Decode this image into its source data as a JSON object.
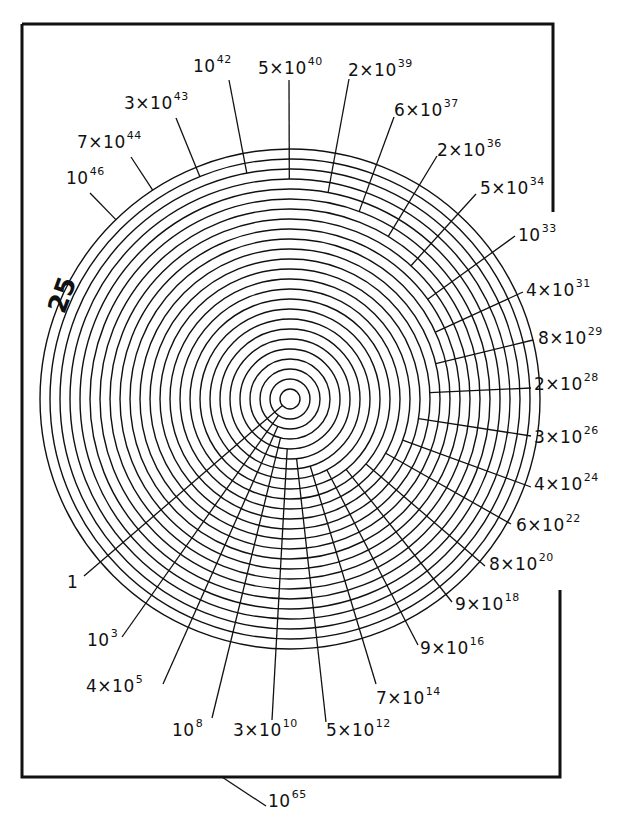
{
  "diagram": {
    "ring_count_label": "25",
    "frame_label": {
      "mantissa": "",
      "base": "10",
      "exp": "65"
    },
    "center": {
      "x": 290,
      "y": 399
    },
    "ring_radius_start": 10,
    "ring_radius_step": 10,
    "ring_count": 25,
    "stroke_color": "#111111",
    "background": "#ffffff",
    "labels": [
      {
        "ring": 1,
        "mantissa": "",
        "base": "1",
        "exp": "",
        "x": 67,
        "y": 582,
        "ax": 84,
        "ay": 576
      },
      {
        "ring": 2,
        "mantissa": "",
        "base": "10",
        "exp": "3",
        "x": 87,
        "y": 640,
        "ax": 122,
        "ay": 637
      },
      {
        "ring": 3,
        "mantissa": "4×",
        "base": "10",
        "exp": "5",
        "x": 86,
        "y": 686,
        "ax": 163,
        "ay": 684
      },
      {
        "ring": 4,
        "mantissa": "",
        "base": "10",
        "exp": "8",
        "x": 172,
        "y": 730,
        "ax": 212,
        "ay": 718
      },
      {
        "ring": 5,
        "mantissa": "3×",
        "base": "10",
        "exp": "10",
        "x": 233,
        "y": 730,
        "ax": 272,
        "ay": 720
      },
      {
        "ring": 6,
        "mantissa": "5×",
        "base": "10",
        "exp": "12",
        "x": 326,
        "y": 730,
        "ax": 326,
        "ay": 722
      },
      {
        "ring": 7,
        "mantissa": "7×",
        "base": "10",
        "exp": "14",
        "x": 376,
        "y": 698,
        "ax": 376,
        "ay": 684
      },
      {
        "ring": 8,
        "mantissa": "9×",
        "base": "10",
        "exp": "16",
        "x": 420,
        "y": 648,
        "ax": 418,
        "ay": 645
      },
      {
        "ring": 9,
        "mantissa": "9×",
        "base": "10",
        "exp": "18",
        "x": 455,
        "y": 604,
        "ax": 452,
        "ay": 602
      },
      {
        "ring": 10,
        "mantissa": "8×",
        "base": "10",
        "exp": "20",
        "x": 489,
        "y": 564,
        "ax": 485,
        "ay": 566
      },
      {
        "ring": 11,
        "mantissa": "6×",
        "base": "10",
        "exp": "22",
        "x": 516,
        "y": 525,
        "ax": 511,
        "ay": 524
      },
      {
        "ring": 12,
        "mantissa": "4×",
        "base": "10",
        "exp": "24",
        "x": 534,
        "y": 484,
        "ax": 531,
        "ay": 487
      },
      {
        "ring": 13,
        "mantissa": "3×",
        "base": "10",
        "exp": "26",
        "x": 534,
        "y": 437,
        "ax": 531,
        "ay": 436
      },
      {
        "ring": 14,
        "mantissa": "2×",
        "base": "10",
        "exp": "28",
        "x": 534,
        "y": 384,
        "ax": 531,
        "ay": 388
      },
      {
        "ring": 15,
        "mantissa": "8×",
        "base": "10",
        "exp": "29",
        "x": 538,
        "y": 338,
        "ax": 533,
        "ay": 340
      },
      {
        "ring": 16,
        "mantissa": "4×",
        "base": "10",
        "exp": "31",
        "x": 526,
        "y": 290,
        "ax": 523,
        "ay": 292
      },
      {
        "ring": 17,
        "mantissa": "",
        "base": "10",
        "exp": "33",
        "x": 518,
        "y": 235,
        "ax": 515,
        "ay": 236
      },
      {
        "ring": 18,
        "mantissa": "5×",
        "base": "10",
        "exp": "34",
        "x": 480,
        "y": 188,
        "ax": 476,
        "ay": 194
      },
      {
        "ring": 19,
        "mantissa": "2×",
        "base": "10",
        "exp": "36",
        "x": 437,
        "y": 150,
        "ax": 437,
        "ay": 156
      },
      {
        "ring": 20,
        "mantissa": "6×",
        "base": "10",
        "exp": "37",
        "x": 394,
        "y": 110,
        "ax": 394,
        "ay": 117
      },
      {
        "ring": 21,
        "mantissa": "2×",
        "base": "10",
        "exp": "39",
        "x": 348,
        "y": 70,
        "ax": 349,
        "ay": 79
      },
      {
        "ring": 22,
        "mantissa": "5×",
        "base": "10",
        "exp": "40",
        "x": 258,
        "y": 68,
        "ax": 289,
        "ay": 80
      },
      {
        "ring": 23,
        "mantissa": "",
        "base": "10",
        "exp": "42",
        "x": 193,
        "y": 66,
        "ax": 229,
        "ay": 80
      },
      {
        "ring": 24,
        "mantissa": "3×",
        "base": "10",
        "exp": "43",
        "x": 124,
        "y": 103,
        "ax": 176,
        "ay": 118
      },
      {
        "ring": 25,
        "mantissa": "7×",
        "base": "10",
        "exp": "44",
        "x": 77,
        "y": 142,
        "ax": 131,
        "ay": 157
      },
      {
        "ring": 26,
        "mantissa": "",
        "base": "10",
        "exp": "46",
        "x": 66,
        "y": 178,
        "ax": 90,
        "ay": 193
      }
    ]
  }
}
